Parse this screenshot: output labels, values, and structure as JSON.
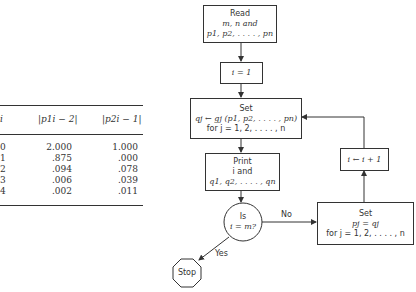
{
  "table": {
    "headers": [
      "i",
      "|p1i − 2|",
      "|p2i − 1|"
    ],
    "rows": [
      [
        "0",
        "2.000",
        "1.000"
      ],
      [
        "1",
        ".875",
        ".000"
      ],
      [
        "2",
        ".094",
        ".078"
      ],
      [
        "3",
        ".006",
        ".039"
      ],
      [
        "4",
        ".002",
        ".011"
      ]
    ]
  },
  "flowchart": {
    "read": {
      "line1": "Read",
      "line2": "m, n and",
      "line3": "p1, p2, . . . . , pn"
    },
    "init": {
      "text": "i = 1"
    },
    "set_q": {
      "line1": "Set",
      "line2": "qj ← gj (p1, p2, . . . . , pn)",
      "line3": "for j = 1, 2, . . . . , n"
    },
    "print": {
      "line1": "Print",
      "line2": "i and",
      "line3": "q1, q2, . . . . , qn"
    },
    "decision": {
      "line1": "Is",
      "line2": "i = m?"
    },
    "stop": {
      "text": "Stop"
    },
    "set_p": {
      "line1": "Set",
      "line2": "pj = qj",
      "line3": "for j = 1, 2, . . . . , n"
    },
    "increment": {
      "text": "i ← i + 1"
    },
    "labels": {
      "yes": "Yes",
      "no": "No"
    }
  }
}
